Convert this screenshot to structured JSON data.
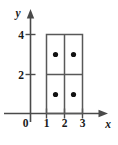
{
  "figure": {
    "title": "",
    "axes": {
      "x_label": "x",
      "y_label": "y",
      "origin_label": "0",
      "x_ticks": [
        {
          "value": 1,
          "label": "1"
        },
        {
          "value": 2,
          "label": "2"
        },
        {
          "value": 3,
          "label": "3"
        }
      ],
      "y_ticks": [
        {
          "value": 2,
          "label": "2"
        },
        {
          "value": 4,
          "label": "4"
        }
      ],
      "xlim": [
        0,
        3.7
      ],
      "ylim": [
        0,
        4.6
      ]
    },
    "shape": {
      "type": "rectangle",
      "x_min": 1,
      "x_max": 3,
      "y_min": 0,
      "y_max": 4,
      "grid_columns": 2,
      "grid_rows": 2,
      "vertical_dividers": [
        2
      ],
      "horizontal_dividers": [
        2
      ]
    },
    "points": [
      {
        "x": 1.5,
        "y": 3
      },
      {
        "x": 2.5,
        "y": 3
      },
      {
        "x": 1.5,
        "y": 1
      },
      {
        "x": 2.5,
        "y": 1
      }
    ],
    "colors": {
      "axis": "#4a4a4a",
      "shape_outline": "#585858",
      "dot": "#111111",
      "text": "#1a1a1a",
      "background": "#ffffff"
    }
  }
}
